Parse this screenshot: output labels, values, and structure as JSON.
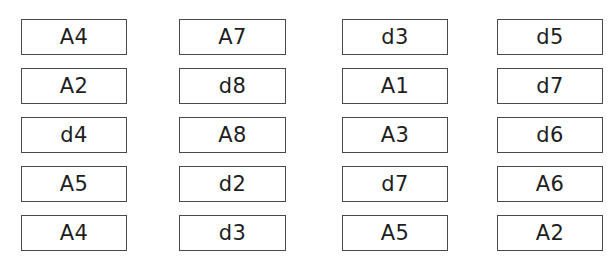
{
  "layout": {
    "columns_x": [
      21,
      179,
      342,
      497
    ],
    "column_widths": [
      106,
      107,
      106,
      106
    ],
    "rows_y": [
      19,
      68,
      117,
      166,
      215
    ],
    "card_height": 36
  },
  "cards": [
    [
      "A4",
      "A7",
      "d3",
      "d5"
    ],
    [
      "A2",
      "d8",
      "A1",
      "d7"
    ],
    [
      "d4",
      "A8",
      "A3",
      "d6"
    ],
    [
      "A5",
      "d2",
      "d7",
      "A6"
    ],
    [
      "A4",
      "d3",
      "A5",
      "A2"
    ]
  ],
  "colors": {
    "border": "#4a4a4a",
    "text": "#1e1e1e",
    "background": "#ffffff"
  }
}
